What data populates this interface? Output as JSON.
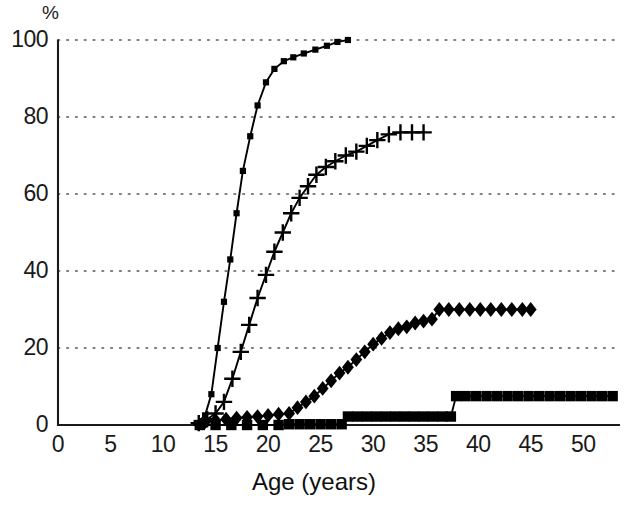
{
  "chart_data": {
    "type": "line",
    "title": "",
    "xlabel": "Age (years)",
    "ylabel": "%",
    "yunit": "%",
    "xlim": [
      0,
      53.5
    ],
    "ylim": [
      0,
      100
    ],
    "xticks": [
      0,
      5,
      10,
      15,
      20,
      25,
      30,
      35,
      40,
      45,
      50
    ],
    "yticks": [
      0,
      20,
      40,
      60,
      80,
      100
    ],
    "grid": "horizontal-dotted",
    "legend": "none",
    "series": [
      {
        "name": "steep-small-square-curve",
        "marker": "small-square",
        "x": [
          13.2,
          14.0,
          14.6,
          15.2,
          15.8,
          16.4,
          17.0,
          17.6,
          18.3,
          19.0,
          19.8,
          20.6,
          21.5,
          22.4,
          23.4,
          24.5,
          25.6,
          26.6,
          27.6
        ],
        "y": [
          0.5,
          2.5,
          8.0,
          20.0,
          32.0,
          43.0,
          55.0,
          66.0,
          75.0,
          83.0,
          89.0,
          92.5,
          94.5,
          95.5,
          96.5,
          97.5,
          98.5,
          99.5,
          100.0
        ]
      },
      {
        "name": "plus-marker-curve",
        "marker": "plus",
        "x": [
          13.4,
          14.2,
          15.0,
          15.8,
          16.6,
          17.4,
          18.2,
          19.0,
          19.8,
          20.6,
          21.4,
          22.2,
          23.0,
          23.8,
          24.6,
          25.5,
          26.4,
          27.4,
          28.4,
          29.4,
          30.4,
          31.5,
          32.6,
          33.7,
          34.8
        ],
        "y": [
          0.5,
          1.5,
          3.0,
          6.0,
          12.0,
          19.0,
          26.0,
          33.0,
          39.0,
          45.0,
          50.0,
          55.0,
          59.0,
          62.0,
          65.0,
          67.0,
          68.5,
          70.0,
          71.0,
          72.5,
          74.0,
          75.5,
          76.0,
          76.0,
          76.0
        ]
      },
      {
        "name": "diamond-marker-curve",
        "marker": "diamond",
        "x": [
          14.0,
          15.0,
          16.0,
          17.0,
          18.0,
          19.0,
          20.0,
          21.0,
          22.0,
          22.8,
          23.6,
          24.4,
          25.2,
          26.0,
          26.8,
          27.6,
          28.4,
          29.2,
          30.0,
          30.8,
          31.6,
          32.4,
          33.2,
          34.0,
          34.8,
          35.6,
          36.3,
          37.2,
          38.2,
          39.2,
          40.2,
          41.2,
          42.2,
          43.2,
          44.2,
          45.0
        ],
        "y": [
          0.8,
          1.2,
          1.5,
          1.8,
          2.0,
          2.2,
          2.5,
          2.8,
          3.0,
          4.5,
          6.0,
          7.5,
          9.5,
          11.5,
          13.5,
          15.0,
          17.0,
          19.0,
          21.0,
          22.5,
          24.0,
          25.0,
          25.5,
          26.5,
          27.0,
          27.5,
          30.0,
          30.0,
          30.0,
          30.0,
          30.0,
          30.0,
          30.0,
          30.0,
          30.0,
          30.0
        ]
      },
      {
        "name": "large-square-step-curve",
        "marker": "large-square",
        "x": [
          13.5,
          15.0,
          16.5,
          18.0,
          19.5,
          21.0,
          22.0,
          23.0,
          24.0,
          25.0,
          26.0,
          27.0,
          27.6,
          28.5,
          29.4,
          30.3,
          31.2,
          32.1,
          33.0,
          33.9,
          34.8,
          35.7,
          36.6,
          37.4,
          37.9,
          38.8,
          39.8,
          40.8,
          41.8,
          42.8,
          43.8,
          44.8,
          45.8,
          46.8,
          47.8,
          48.8,
          49.8,
          50.8,
          51.8,
          52.8
        ],
        "y": [
          0.0,
          0.0,
          0.0,
          0.0,
          0.0,
          0.0,
          0.2,
          0.2,
          0.2,
          0.2,
          0.2,
          0.2,
          2.2,
          2.2,
          2.2,
          2.2,
          2.2,
          2.2,
          2.2,
          2.2,
          2.2,
          2.2,
          2.2,
          2.2,
          7.5,
          7.5,
          7.5,
          7.5,
          7.5,
          7.5,
          7.5,
          7.5,
          7.5,
          7.5,
          7.5,
          7.5,
          7.5,
          7.5,
          7.5,
          7.5
        ]
      }
    ],
    "colors": {
      "series_line": "#000000",
      "axis": "#1a1a1a",
      "grid": "#555555",
      "background": "#ffffff"
    }
  }
}
